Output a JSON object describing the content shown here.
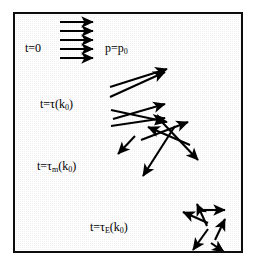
{
  "figure": {
    "name": "momentum-relaxation-diagram",
    "border_color": "#0d0d0d",
    "background_color": "#f0f0f0",
    "arrow_color": "#000000"
  },
  "labels": {
    "initial_time": "t=0",
    "initial_momentum_prefix": "p=p",
    "initial_momentum_sub": "0",
    "scatter_prefix": "t=τ(k",
    "scatter_sub": "0",
    "scatter_suffix": ")",
    "momentum_prefix": "t=τ",
    "momentum_sub_main": "m",
    "momentum_mid": "(k",
    "momentum_sub": "0",
    "momentum_suffix": ")",
    "energy_prefix": "t=τ",
    "energy_sub_main": "E",
    "energy_mid": "(k",
    "energy_sub": "0",
    "energy_suffix": ")"
  },
  "chart_data": {
    "type": "diagram",
    "title": "",
    "groups": [
      {
        "id": "t0",
        "label": "t=0",
        "description": "all momenta aligned along +x, identical magnitude",
        "arrow_count": 5,
        "arrows": [
          {
            "x1": 45,
            "y1": 8,
            "x2": 78,
            "y2": 8
          },
          {
            "x1": 45,
            "y1": 17,
            "x2": 78,
            "y2": 17
          },
          {
            "x1": 45,
            "y1": 26,
            "x2": 78,
            "y2": 26
          },
          {
            "x1": 45,
            "y1": 35,
            "x2": 78,
            "y2": 35
          },
          {
            "x1": 45,
            "y1": 44,
            "x2": 78,
            "y2": 44
          }
        ]
      },
      {
        "id": "tau",
        "label": "t=tau(k0)",
        "description": "small angular spread, momenta still mostly forward",
        "arrow_count": 5,
        "arrows": [
          {
            "x1": 95,
            "y1": 73,
            "x2": 152,
            "y2": 55
          },
          {
            "x1": 95,
            "y1": 83,
            "x2": 150,
            "y2": 58
          },
          {
            "x1": 98,
            "y1": 105,
            "x2": 150,
            "y2": 90
          },
          {
            "x1": 96,
            "y1": 96,
            "x2": 152,
            "y2": 108
          },
          {
            "x1": 96,
            "y1": 112,
            "x2": 150,
            "y2": 104
          }
        ]
      },
      {
        "id": "tau_m",
        "label": "t=tau_m(k0)",
        "description": "momentum randomized, directions broadly spread, magnitude preserved",
        "arrow_count": 5,
        "arrows": [
          {
            "x1": 126,
            "y1": 126,
            "x2": 173,
            "y2": 108
          },
          {
            "x1": 175,
            "y1": 131,
            "x2": 133,
            "y2": 113
          },
          {
            "x1": 160,
            "y1": 112,
            "x2": 128,
            "y2": 162
          },
          {
            "x1": 146,
            "y1": 107,
            "x2": 183,
            "y2": 146
          },
          {
            "x1": 120,
            "y1": 122,
            "x2": 103,
            "y2": 140
          }
        ]
      },
      {
        "id": "tau_e",
        "label": "t=tau_E(k0)",
        "description": "fully isotropic with reduced magnitudes after energy relaxation",
        "arrow_count": 6,
        "arrows": [
          {
            "x1": 192,
            "y1": 212,
            "x2": 182,
            "y2": 190
          },
          {
            "x1": 193,
            "y1": 209,
            "x2": 168,
            "y2": 198
          },
          {
            "x1": 186,
            "y1": 196,
            "x2": 210,
            "y2": 196
          },
          {
            "x1": 200,
            "y1": 226,
            "x2": 210,
            "y2": 205
          },
          {
            "x1": 193,
            "y1": 215,
            "x2": 178,
            "y2": 236
          },
          {
            "x1": 196,
            "y1": 229,
            "x2": 209,
            "y2": 238
          }
        ]
      }
    ]
  }
}
